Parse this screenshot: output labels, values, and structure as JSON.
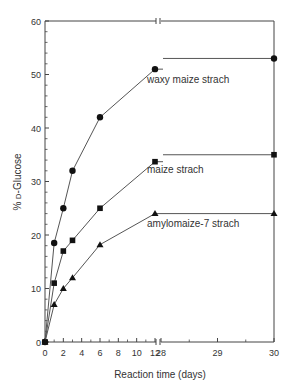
{
  "chart_data": {
    "type": "line",
    "title": "",
    "xlabel": "Reaction time (days)",
    "ylabel": "% D-Glucose",
    "ylim": [
      0,
      60
    ],
    "yticks": [
      0,
      10,
      20,
      30,
      40,
      50,
      60
    ],
    "xaxis_segments": [
      {
        "range": [
          0,
          12
        ],
        "ticks": [
          0,
          2,
          4,
          6,
          8,
          10,
          12
        ]
      },
      {
        "range": [
          28,
          30
        ],
        "ticks": [
          28,
          29,
          30
        ]
      }
    ],
    "axis_break": "between 12 and 28 (double-slash break marks on top and bottom axes)",
    "grid": false,
    "legend_position": "inline labels next to each series",
    "series": [
      {
        "name": "waxy maize strach",
        "marker": "circle",
        "x": [
          0,
          1,
          2,
          3,
          6,
          12,
          30
        ],
        "values": [
          0,
          18.5,
          25,
          32,
          42,
          51,
          53
        ]
      },
      {
        "name": "maize strach",
        "marker": "square",
        "x": [
          0,
          1,
          2,
          3,
          6,
          12,
          30
        ],
        "values": [
          0,
          11,
          17,
          19,
          25,
          33.7,
          35
        ]
      },
      {
        "name": "amylomaize-7 strach",
        "marker": "triangle",
        "x": [
          0,
          1,
          2,
          3,
          6,
          12,
          30
        ],
        "values": [
          0,
          7,
          10,
          12,
          18.2,
          24,
          24
        ]
      }
    ]
  },
  "labels": {
    "xlabel": "Reaction time (days)",
    "ylabel_prefix": "% ",
    "ylabel_small": "D",
    "ylabel_suffix": "-Glucose",
    "series0": "waxy maize strach",
    "series1": "maize strach",
    "series2": "amylomaize-7 strach"
  }
}
